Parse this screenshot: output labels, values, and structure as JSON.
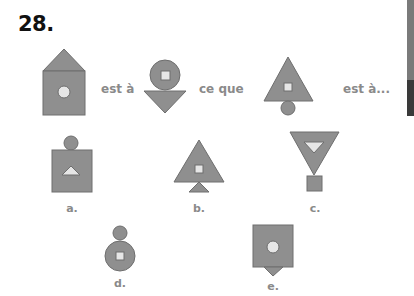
{
  "question": {
    "number": "28.",
    "analogy_words": {
      "first": "est à",
      "second": "ce que",
      "third": "est à..."
    }
  },
  "options": [
    {
      "key": "a",
      "label": "a."
    },
    {
      "key": "b",
      "label": "b."
    },
    {
      "key": "c",
      "label": "c."
    },
    {
      "key": "d",
      "label": "d."
    },
    {
      "key": "e",
      "label": "e."
    }
  ],
  "colors": {
    "shape_fill": "#8f8f8f",
    "shape_stroke": "#6e6e6e",
    "inner_fill": "#e6e6e6",
    "text_gray": "#8a8a8a",
    "edge_bar_light": "#7a7a7a",
    "edge_bar_dark": "#3a3a3a"
  }
}
